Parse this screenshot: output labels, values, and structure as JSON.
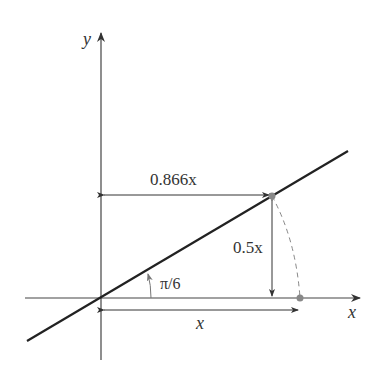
{
  "diagram": {
    "axes": {
      "x_label": "x",
      "y_label": "y"
    },
    "angle_label": "π/6",
    "horizontal_label": "0.866x",
    "vertical_label": "0.5x",
    "base_label": "x",
    "colors": {
      "line": "#222222",
      "axis": "#444444",
      "point": "#888888",
      "arc": "#888888"
    }
  }
}
